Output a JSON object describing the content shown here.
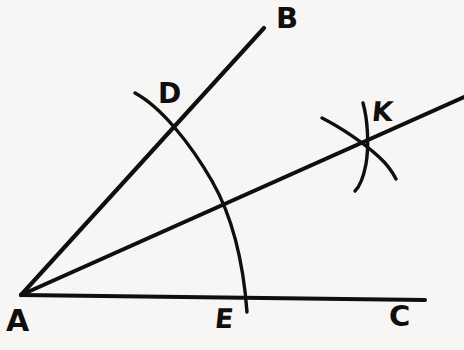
{
  "figure": {
    "background_color": "#f7f6f4",
    "ink_color": "#100f0d",
    "labels": {
      "A": "A",
      "B": "B",
      "C": "C",
      "D": "D",
      "E": "E",
      "K": "K"
    },
    "points": {
      "A": {
        "x": 21,
        "y": 295,
        "role": "vertex"
      },
      "B": {
        "x": 264,
        "y": 28,
        "role": "ray-endpoint"
      },
      "C": {
        "x": 425,
        "y": 300,
        "role": "ray-endpoint"
      },
      "D": {
        "x": 175,
        "y": 122,
        "role": "arc-intersection-on-ray-AB"
      },
      "E": {
        "x": 246,
        "y": 303,
        "role": "arc-intersection-on-ray-AC"
      },
      "K": {
        "x": 365,
        "y": 144,
        "role": "arc-arc-intersection-on-bisector"
      }
    },
    "segments": [
      {
        "name": "ray-AB",
        "from": [
          21,
          295
        ],
        "to": [
          264,
          28
        ]
      },
      {
        "name": "ray-AC",
        "from": [
          21,
          295
        ],
        "to": [
          425,
          300
        ]
      },
      {
        "name": "ray-bisector-AK",
        "from": [
          21,
          295
        ],
        "to": [
          464,
          97
        ]
      }
    ],
    "arcs": [
      {
        "name": "arc-DE",
        "center": [
          21,
          295
        ],
        "radius": 226,
        "path": "M 135 93 C 161 107 190 143 212 181 C 232 216 243 258 247 312"
      },
      {
        "name": "arc-from-D-near-K",
        "path": "M 363 103 C 368 121 369 146 366 164 C 363 180 359 187 355 191"
      },
      {
        "name": "arc-from-E-near-K",
        "path": "M 322 118 C 340 127 364 143 379 157 C 389 166 393 173 396 179"
      }
    ]
  }
}
